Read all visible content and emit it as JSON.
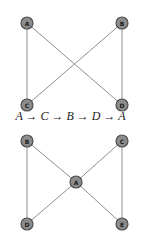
{
  "graph1": {
    "nodes": [
      {
        "id": "A",
        "label": "A",
        "x": 27,
        "y": 23
      },
      {
        "id": "B",
        "label": "B",
        "x": 122,
        "y": 23
      },
      {
        "id": "C",
        "label": "C",
        "x": 27,
        "y": 105
      },
      {
        "id": "D",
        "label": "D",
        "x": 122,
        "y": 105
      }
    ],
    "edges": [
      [
        "A",
        "C"
      ],
      [
        "A",
        "D"
      ],
      [
        "B",
        "C"
      ],
      [
        "B",
        "D"
      ]
    ]
  },
  "caption": "A → C → B → D → A",
  "graph2": {
    "nodes": [
      {
        "id": "B",
        "label": "B",
        "x": 27,
        "y": 141
      },
      {
        "id": "C",
        "label": "C",
        "x": 122,
        "y": 141
      },
      {
        "id": "A",
        "label": "A",
        "x": 76,
        "y": 182
      },
      {
        "id": "D",
        "label": "D",
        "x": 27,
        "y": 224
      },
      {
        "id": "E",
        "label": "E",
        "x": 122,
        "y": 224
      }
    ],
    "edges": [
      [
        "B",
        "D"
      ],
      [
        "B",
        "A"
      ],
      [
        "C",
        "A"
      ],
      [
        "C",
        "E"
      ],
      [
        "A",
        "D"
      ],
      [
        "A",
        "E"
      ]
    ]
  },
  "colors": {
    "node_fill": "#8c8c8c",
    "node_stroke": "#4f4f4f",
    "edge": "#8f8f8f",
    "label": "#1a1a1a"
  }
}
